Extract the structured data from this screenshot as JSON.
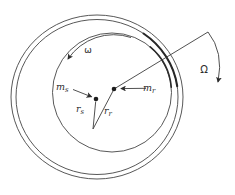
{
  "diagram": {
    "colors": {
      "background": "#ffffff",
      "ink": "#454545",
      "contact_arc": "#272727"
    },
    "labels": {
      "spin": {
        "text": "ω"
      },
      "whirl": {
        "text": "Ω"
      },
      "mass_s": {
        "base": "m",
        "sub": "s"
      },
      "mass_r": {
        "base": "m",
        "sub": "r"
      },
      "radius_s": {
        "base": "r",
        "sub": "s"
      },
      "radius_r": {
        "base": "r",
        "sub": "r"
      }
    }
  }
}
